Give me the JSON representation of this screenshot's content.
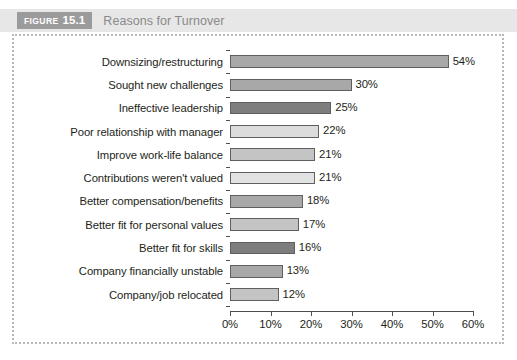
{
  "header": {
    "tag_word": "FIGURE",
    "tag_number": "15.1",
    "title": "Reasons for Turnover"
  },
  "chart_data": {
    "type": "bar",
    "orientation": "horizontal",
    "title": "Reasons for Turnover",
    "xlabel": "",
    "ylabel": "",
    "xlim": [
      0,
      60
    ],
    "xtick_labels": [
      "0%",
      "10%",
      "20%",
      "30%",
      "40%",
      "50%",
      "60%"
    ],
    "xticks": [
      0,
      10,
      20,
      30,
      40,
      50,
      60
    ],
    "grid": false,
    "legend": null,
    "value_suffix": "%",
    "categories": [
      "Downsizing/restructuring",
      "Sought new challenges",
      "Ineffective leadership",
      "Poor relationship with manager",
      "Improve work-life balance",
      "Contributions weren't valued",
      "Better compensation/benefits",
      "Better fit for personal values",
      "Better fit for skills",
      "Company financially unstable",
      "Company/job relocated"
    ],
    "values": [
      54,
      30,
      25,
      22,
      21,
      21,
      18,
      17,
      16,
      13,
      12
    ],
    "value_labels": [
      "54%",
      "30%",
      "25%",
      "22%",
      "21%",
      "21%",
      "18%",
      "17%",
      "16%",
      "13%",
      "12%"
    ],
    "bar_colors": [
      "#a8a8a8",
      "#a8a8a8",
      "#7d7d7d",
      "#dcdcdc",
      "#c4c4c4",
      "#e2e2e2",
      "#a8a8a8",
      "#c4c4c4",
      "#7d7d7d",
      "#a8a8a8",
      "#c4c4c4"
    ]
  },
  "colors": {
    "header_band": "#e7e7e7",
    "tag_background": "#9b9b9b",
    "title_text": "#8a8a8a",
    "frame_border": "#b8b8b8",
    "axis": "#4d4d4d",
    "bar_outline": "#5f5f5f",
    "text": "#231f20"
  }
}
